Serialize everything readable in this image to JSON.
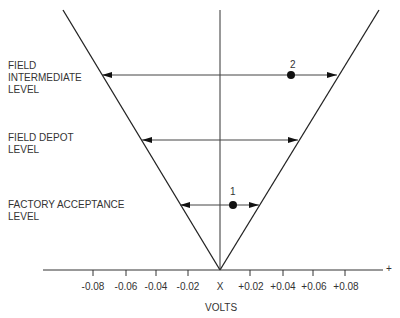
{
  "levels": [
    {
      "lines": [
        "FIELD",
        "INTERMEDIATE",
        "LEVEL"
      ]
    },
    {
      "lines": [
        "FIELD DEPOT",
        "LEVEL"
      ]
    },
    {
      "lines": [
        "FACTORY ACCEPTANCE",
        "LEVEL"
      ]
    }
  ],
  "points": [
    {
      "label": "1"
    },
    {
      "label": "2"
    }
  ],
  "axis": {
    "origin_label": "X",
    "plus_label": "+",
    "title": "VOLTS",
    "ticks": [
      "-0.08",
      "-0.06",
      "-0.04",
      "-0.02",
      "+0.02",
      "+0.04",
      "+0.06",
      "+0.08"
    ]
  },
  "colors": {
    "line": "#222222",
    "arrow": "#555555",
    "text": "#333333"
  }
}
